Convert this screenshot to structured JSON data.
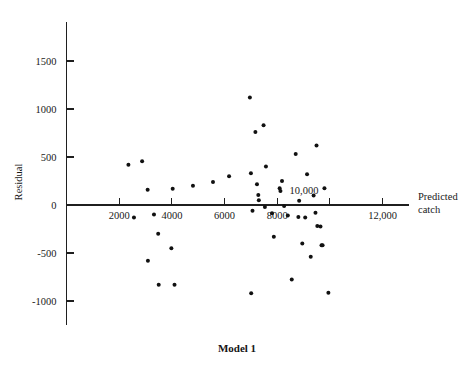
{
  "chart_data": {
    "type": "scatter",
    "title": "",
    "caption": "Model 1",
    "xlabel_line1": "Predicted",
    "xlabel_line2": "catch",
    "ylabel": "Residual",
    "xtick_labels": [
      "2000",
      "4000",
      "6000",
      "8000",
      "10,000",
      "12,000"
    ],
    "xtick_values": [
      2000,
      4000,
      6000,
      8000,
      10000,
      12000
    ],
    "ytick_labels": [
      "1500",
      "1000",
      "500",
      "0",
      "-500",
      "-1000"
    ],
    "ytick_values": [
      1500,
      1000,
      500,
      0,
      -500,
      -1000
    ],
    "xlim": [
      0,
      13400
    ],
    "ylim": [
      -1300,
      1800
    ],
    "grid": false,
    "legend": false,
    "series_name": "residuals",
    "points": [
      {
        "x": 2350,
        "y": 420
      },
      {
        "x": 2560,
        "y": -130
      },
      {
        "x": 2870,
        "y": 455
      },
      {
        "x": 3080,
        "y": 160
      },
      {
        "x": 3090,
        "y": -580
      },
      {
        "x": 3320,
        "y": -100
      },
      {
        "x": 3480,
        "y": -300
      },
      {
        "x": 3500,
        "y": -830
      },
      {
        "x": 3980,
        "y": -450
      },
      {
        "x": 4030,
        "y": 170
      },
      {
        "x": 4100,
        "y": -830
      },
      {
        "x": 4800,
        "y": 200
      },
      {
        "x": 5560,
        "y": 240
      },
      {
        "x": 6170,
        "y": 300
      },
      {
        "x": 6960,
        "y": 1120
      },
      {
        "x": 7000,
        "y": 330
      },
      {
        "x": 7060,
        "y": -60
      },
      {
        "x": 7170,
        "y": 760
      },
      {
        "x": 7230,
        "y": 215
      },
      {
        "x": 7280,
        "y": 105
      },
      {
        "x": 7300,
        "y": 50
      },
      {
        "x": 7480,
        "y": 830
      },
      {
        "x": 7530,
        "y": -20
      },
      {
        "x": 7570,
        "y": 400
      },
      {
        "x": 7800,
        "y": -85
      },
      {
        "x": 7870,
        "y": -330
      },
      {
        "x": 8090,
        "y": 175
      },
      {
        "x": 8120,
        "y": 145
      },
      {
        "x": 8180,
        "y": 250
      },
      {
        "x": 8260,
        "y": -10
      },
      {
        "x": 8400,
        "y": -110
      },
      {
        "x": 8550,
        "y": -775
      },
      {
        "x": 8700,
        "y": 530
      },
      {
        "x": 8800,
        "y": -125
      },
      {
        "x": 8830,
        "y": 45
      },
      {
        "x": 8950,
        "y": -400
      },
      {
        "x": 9060,
        "y": -130
      },
      {
        "x": 9130,
        "y": 320
      },
      {
        "x": 9270,
        "y": -540
      },
      {
        "x": 9380,
        "y": 100
      },
      {
        "x": 9450,
        "y": -80
      },
      {
        "x": 9490,
        "y": 620
      },
      {
        "x": 9520,
        "y": -220
      },
      {
        "x": 9640,
        "y": -225
      },
      {
        "x": 9680,
        "y": -420
      },
      {
        "x": 9720,
        "y": -420
      },
      {
        "x": 9790,
        "y": 175
      },
      {
        "x": 9940,
        "y": -915
      },
      {
        "x": 7010,
        "y": -920
      }
    ]
  },
  "axis_color": "#1f1f1f",
  "point_color": "#111111"
}
